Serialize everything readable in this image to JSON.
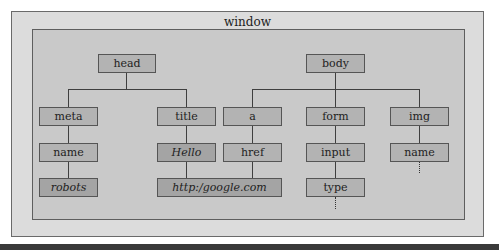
{
  "window": {
    "title": "window"
  },
  "tree": {
    "head": {
      "label": "head",
      "children": {
        "meta": {
          "label": "meta",
          "attr": "name",
          "value": "robots"
        },
        "title": {
          "label": "title",
          "value": "Hello"
        }
      }
    },
    "body": {
      "label": "body",
      "children": {
        "a": {
          "label": "a",
          "attr": "href",
          "value": "http:/google.com"
        },
        "form": {
          "label": "form",
          "child": "input",
          "attr": "type"
        },
        "img": {
          "label": "img",
          "attr": "name"
        }
      }
    }
  },
  "colors": {
    "window_bg": "#dcdcdc",
    "container_bg": "#c9c9c9",
    "node_bg": "#b3b3b3",
    "value_node_bg": "#a4a4a4",
    "border": "#555555"
  }
}
